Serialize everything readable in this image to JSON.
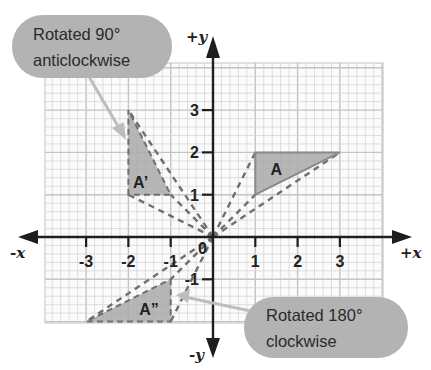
{
  "axes": {
    "x_pos_label": "+x",
    "x_neg_label": "-x",
    "y_pos_label": "+y",
    "y_neg_label": "-y",
    "origin_label": "0",
    "x_ticks": [
      {
        "value": -3,
        "label": "-3"
      },
      {
        "value": -2,
        "label": "-2"
      },
      {
        "value": -1,
        "label": "-1"
      },
      {
        "value": 1,
        "label": "1"
      },
      {
        "value": 2,
        "label": "2"
      },
      {
        "value": 3,
        "label": "3"
      }
    ],
    "y_ticks": [
      {
        "value": 3,
        "label": "3"
      },
      {
        "value": 2,
        "label": "2"
      },
      {
        "value": 1,
        "label": "1"
      },
      {
        "value": -1,
        "label": "-1"
      }
    ],
    "grid_range": {
      "x": [
        -4,
        4
      ],
      "y": [
        -2,
        4
      ]
    },
    "minor_divisions_per_unit": 5
  },
  "shapes": [
    {
      "id": "A",
      "label": "A",
      "vertices": [
        [
          1,
          1
        ],
        [
          1,
          2
        ],
        [
          3,
          2
        ]
      ],
      "label_at": [
        1.5,
        1.6
      ],
      "outline": "solid"
    },
    {
      "id": "A-prime",
      "label": "A’",
      "vertices": [
        [
          -2,
          1
        ],
        [
          -2,
          3
        ],
        [
          -1,
          1
        ]
      ],
      "label_at": [
        -1.75,
        1.3
      ],
      "outline": "dashed"
    },
    {
      "id": "A-double-prime",
      "label": "A”",
      "vertices": [
        [
          -1,
          -1
        ],
        [
          -1,
          -2
        ],
        [
          -3,
          -2
        ]
      ],
      "label_at": [
        -1.6,
        -1.7
      ],
      "outline": "dashed"
    }
  ],
  "callouts": [
    {
      "id": "rotated-90",
      "lines": [
        "Rotated 90°",
        "anticlockwise"
      ],
      "points_to": "A-prime"
    },
    {
      "id": "rotated-180",
      "lines": [
        "Rotated 180°",
        "clockwise"
      ],
      "points_to": "A-double-prime"
    }
  ],
  "colors": {
    "shape_fill": "#a9a9a9",
    "shape_stroke": "#8a8a8a",
    "dashed": "#6f6f6f",
    "bubble": "#b3b3b3",
    "pointer": "#bdbdbd",
    "grid_minor": "#d6d6d6",
    "grid_major": "#c4c4c4",
    "axis": "#1e1e1e"
  }
}
